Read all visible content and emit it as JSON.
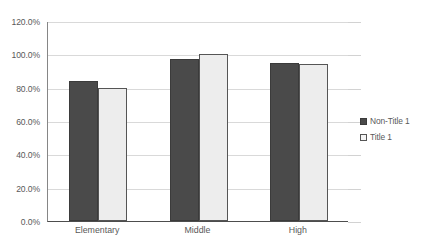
{
  "chart_data": {
    "type": "bar",
    "title": "",
    "subtitle": "",
    "xlabel": "",
    "ylabel": "",
    "categories": [
      "Elementary",
      "Middle",
      "High"
    ],
    "series": [
      {
        "name": "Non-Title 1",
        "color": "#4A4A4A",
        "values": [
          84.0,
          97.0,
          95.0
        ]
      },
      {
        "name": "Title 1",
        "color": "#EDEDED",
        "values": [
          80.0,
          100.0,
          94.5
        ]
      }
    ],
    "ylim": [
      0,
      120
    ],
    "ytick_values": [
      0,
      20,
      40,
      60,
      80,
      100,
      120
    ],
    "ytick_labels": [
      "0.0%",
      "20.0%",
      "40.0%",
      "60.0%",
      "80.0%",
      "100.0%",
      "120.0%"
    ],
    "grid": "horizontal",
    "legend_position": "right",
    "legend": [
      "Non-Title 1",
      "Title 1"
    ]
  }
}
